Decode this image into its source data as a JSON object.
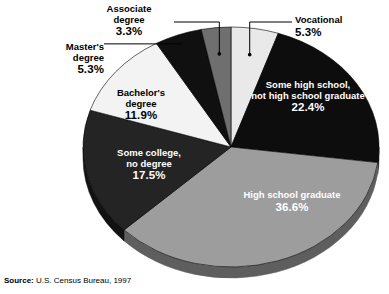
{
  "source": {
    "label": "Source:",
    "value": "U.S. Census Bureau, 1997"
  },
  "chart_data": {
    "type": "pie",
    "title": "",
    "xlabel": "",
    "ylabel": "",
    "units": "percent",
    "legend": "none",
    "labels_position": "on-slice and external with leader lines",
    "three_d": true,
    "start_angle_deg": 0,
    "direction": "clockwise",
    "categories": [
      "Vocational",
      "Some high school, not high school graduate",
      "High school graduate",
      "Some college, no degree",
      "Bachelor's degree",
      "Master's degree",
      "Associate degree"
    ],
    "values": [
      5.3,
      22.4,
      36.6,
      17.5,
      11.9,
      5.3,
      3.3
    ],
    "slices": [
      {
        "name": "Vocational",
        "label_line1": "Vocational",
        "label_line2": "",
        "percent_text": "5.3%",
        "value": 5.3,
        "color": "#e9e9e9",
        "side_color": "#b9b9b9",
        "label_placement": "outside",
        "text_color": "#000000"
      },
      {
        "name": "Some high school",
        "label_line1": "Some high school,",
        "label_line2": "not high school graduate",
        "percent_text": "22.4%",
        "value": 22.4,
        "color": "#0d0d0d",
        "side_color": "#080808",
        "label_placement": "inside",
        "text_color": "#ffffff"
      },
      {
        "name": "High school graduate",
        "label_line1": "High school graduate",
        "label_line2": "",
        "percent_text": "36.6%",
        "value": 36.6,
        "color": "#9d9d9d",
        "side_color": "#5e5e5e",
        "label_placement": "inside",
        "text_color": "#ffffff"
      },
      {
        "name": "Some college, no degree",
        "label_line1": "Some college,",
        "label_line2": "no degree",
        "percent_text": "17.5%",
        "value": 17.5,
        "color": "#242424",
        "side_color": "#121212",
        "label_placement": "inside",
        "text_color": "#ffffff"
      },
      {
        "name": "Bachelor's degree",
        "label_line1": "Bachelor's",
        "label_line2": "degree",
        "percent_text": "11.9%",
        "value": 11.9,
        "color": "#f3f3f3",
        "side_color": "#c6c6c6",
        "label_placement": "inside",
        "text_color": "#000000"
      },
      {
        "name": "Master's degree",
        "label_line1": "Master's",
        "label_line2": "degree",
        "percent_text": "5.3%",
        "value": 5.3,
        "color": "#101010",
        "side_color": "#080808",
        "label_placement": "outside",
        "text_color": "#000000"
      },
      {
        "name": "Associate degree",
        "label_line1": "Associate",
        "label_line2": "degree",
        "percent_text": "3.3%",
        "value": 3.3,
        "color": "#6f6f6f",
        "side_color": "#474747",
        "label_placement": "outside",
        "text_color": "#000000"
      }
    ]
  }
}
